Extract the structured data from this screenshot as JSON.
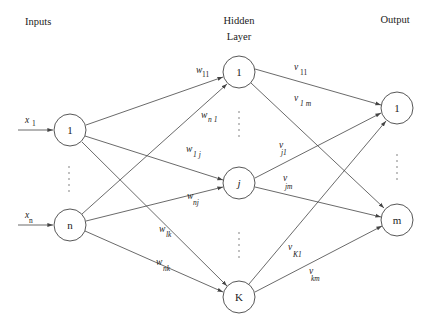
{
  "headers": {
    "inputs": "Inputs",
    "hidden_line1": "Hidden",
    "hidden_line2": "Layer",
    "output": "Output"
  },
  "input_layer": {
    "nodes": [
      {
        "id": "in-1",
        "label": "1",
        "cx": 70,
        "cy": 130
      },
      {
        "id": "in-n",
        "label": "n",
        "cx": 70,
        "cy": 225
      }
    ],
    "inputs": [
      {
        "symbol": "x",
        "subscript": "1"
      },
      {
        "symbol": "x",
        "subscript": "n"
      }
    ]
  },
  "hidden_layer": {
    "nodes": [
      {
        "id": "hid-1",
        "label": "1",
        "cx": 239,
        "cy": 72
      },
      {
        "id": "hid-j",
        "label": "j",
        "cx": 239,
        "cy": 183
      },
      {
        "id": "hid-K",
        "label": "K",
        "cx": 239,
        "cy": 297
      }
    ]
  },
  "output_layer": {
    "nodes": [
      {
        "id": "out-1",
        "label": "1",
        "cx": 397,
        "cy": 108
      },
      {
        "id": "out-m",
        "label": "m",
        "cx": 397,
        "cy": 220
      }
    ]
  },
  "weights_input_hidden": [
    {
      "symbol": "w",
      "subscript": "11"
    },
    {
      "symbol": "w",
      "subscript": "n 1"
    },
    {
      "symbol": "w",
      "subscript": "1 j"
    },
    {
      "symbol": "w",
      "subscript": "nj"
    },
    {
      "symbol": "w",
      "subscript": "lk"
    },
    {
      "symbol": "w",
      "subscript": "nk"
    }
  ],
  "weights_hidden_output": [
    {
      "symbol": "v",
      "subscript": "11"
    },
    {
      "symbol": "v",
      "subscript": "1 m"
    },
    {
      "symbol": "v",
      "subscript": "j1"
    },
    {
      "symbol": "v",
      "subscript": "jm"
    },
    {
      "symbol": "v",
      "subscript": "K1"
    },
    {
      "symbol": "v",
      "subscript": "km"
    }
  ],
  "colors": {
    "stroke": "#444444",
    "text": "#222222",
    "background": "#ffffff"
  }
}
